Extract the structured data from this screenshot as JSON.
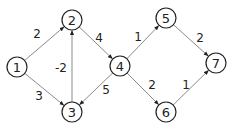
{
  "graph": {
    "type": "directed-weighted",
    "nodes": [
      {
        "id": "1",
        "label": "1",
        "x": 17,
        "y": 67
      },
      {
        "id": "2",
        "label": "2",
        "x": 72,
        "y": 20
      },
      {
        "id": "3",
        "label": "3",
        "x": 72,
        "y": 112
      },
      {
        "id": "4",
        "label": "4",
        "x": 120,
        "y": 66
      },
      {
        "id": "5",
        "label": "5",
        "x": 166,
        "y": 18
      },
      {
        "id": "6",
        "label": "6",
        "x": 166,
        "y": 112
      },
      {
        "id": "7",
        "label": "7",
        "x": 216,
        "y": 63
      }
    ],
    "edges": [
      {
        "from": "1",
        "to": "2",
        "weight": "2",
        "lx": 37,
        "ly": 34
      },
      {
        "from": "1",
        "to": "3",
        "weight": "3",
        "lx": 39,
        "ly": 96
      },
      {
        "from": "3",
        "to": "2",
        "weight": "-2",
        "lx": 61,
        "ly": 68
      },
      {
        "from": "2",
        "to": "4",
        "weight": "4",
        "lx": 99,
        "ly": 38
      },
      {
        "from": "4",
        "to": "3",
        "weight": "5",
        "lx": 106,
        "ly": 90
      },
      {
        "from": "4",
        "to": "5",
        "weight": "1",
        "lx": 138,
        "ly": 37
      },
      {
        "from": "4",
        "to": "6",
        "weight": "2",
        "lx": 152,
        "ly": 85
      },
      {
        "from": "5",
        "to": "7",
        "weight": "2",
        "lx": 200,
        "ly": 38
      },
      {
        "from": "6",
        "to": "7",
        "weight": "1",
        "lx": 186,
        "ly": 85
      }
    ],
    "node_radius": 10,
    "colors": {
      "edge": "#8a8a8a",
      "node_stroke": "#222222",
      "text": "#222222"
    }
  }
}
